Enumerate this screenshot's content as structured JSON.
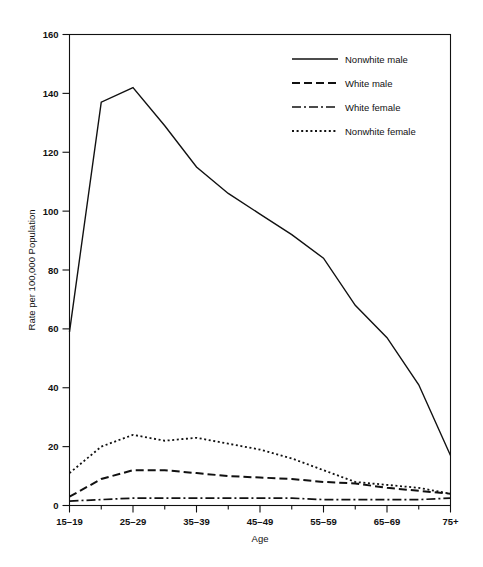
{
  "chart_data": {
    "type": "line",
    "title": "",
    "xlabel": "Age",
    "ylabel": "Rate per 100,000 Population",
    "grid": false,
    "legend_position": "top-right",
    "ylim": [
      0,
      160
    ],
    "y_ticks": [
      0,
      20,
      40,
      60,
      80,
      100,
      120,
      140,
      160
    ],
    "y_tick_labels": [
      "0",
      "20",
      "40",
      "60",
      "80",
      "100",
      "120",
      "140",
      "160"
    ],
    "x": [
      "15-19",
      "20-24",
      "25-29",
      "30-34",
      "35-39",
      "40-44",
      "45-49",
      "50-54",
      "55-59",
      "60-64",
      "65-69",
      "70-74",
      "75+"
    ],
    "x_tick_labels": [
      "15–19",
      "25–29",
      "35–39",
      "45–49",
      "55–59",
      "65–69",
      "75+"
    ],
    "x_labeled_indices": [
      0,
      2,
      4,
      6,
      8,
      10,
      12
    ],
    "series": [
      {
        "name": "Nonwhite male",
        "line_style": "solid",
        "color": "#111111",
        "values": [
          59,
          137,
          142,
          129,
          115,
          106,
          99,
          92,
          84,
          68,
          57,
          41,
          17
        ]
      },
      {
        "name": "White male",
        "line_style": "dashed",
        "color": "#111111",
        "values": [
          3,
          9,
          12,
          12,
          11,
          10,
          9.5,
          9,
          8,
          7.5,
          6,
          5,
          4
        ]
      },
      {
        "name": "White female",
        "line_style": "dash-dot",
        "color": "#111111",
        "values": [
          1.5,
          2,
          2.5,
          2.5,
          2.5,
          2.5,
          2.5,
          2.5,
          2,
          2,
          2,
          2,
          2.5
        ]
      },
      {
        "name": "Nonwhite female",
        "line_style": "dotted",
        "color": "#111111",
        "values": [
          11,
          20,
          24,
          22,
          23,
          21,
          19,
          16,
          12,
          8,
          7,
          6,
          4
        ]
      }
    ]
  },
  "legend": {
    "items": [
      {
        "label": "Nonwhite male",
        "style": "solid"
      },
      {
        "label": "White male",
        "style": "dashed"
      },
      {
        "label": "White female",
        "style": "dash-dot"
      },
      {
        "label": "Nonwhite female",
        "style": "dotted"
      }
    ]
  }
}
